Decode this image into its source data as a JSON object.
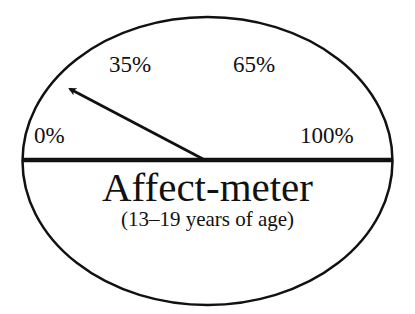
{
  "diagram": {
    "title": "Affect-meter",
    "subtitle": "(13–19 years of age)",
    "scale_labels": [
      "0%",
      "35%",
      "65%",
      "100%"
    ],
    "needle_icon": "arrow-needle-icon",
    "colors": {
      "stroke": "#111111",
      "background": "#ffffff"
    }
  }
}
